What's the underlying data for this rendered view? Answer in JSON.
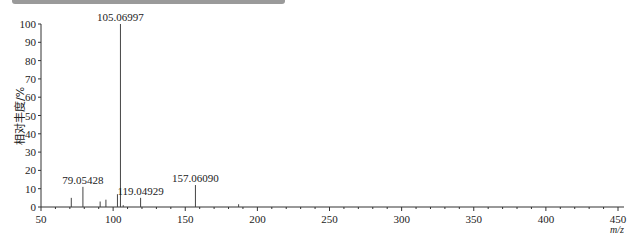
{
  "chart_data": {
    "type": "bar",
    "title": "",
    "xlabel": "m/z",
    "ylabel": "相对丰度/%",
    "xlim": [
      50,
      455
    ],
    "ylim": [
      0,
      100
    ],
    "x_ticks": [
      50,
      100,
      150,
      200,
      250,
      300,
      350,
      400,
      450
    ],
    "y_ticks": [
      0,
      10,
      20,
      30,
      40,
      50,
      60,
      70,
      80,
      90,
      100
    ],
    "grid": false,
    "legend": null,
    "peaks": [
      {
        "mz": 71,
        "intensity": 5
      },
      {
        "mz": 79.05428,
        "intensity": 11,
        "label": "79.05428"
      },
      {
        "mz": 91,
        "intensity": 3
      },
      {
        "mz": 95,
        "intensity": 4
      },
      {
        "mz": 103,
        "intensity": 7
      },
      {
        "mz": 105.06997,
        "intensity": 100,
        "label": "105.06997"
      },
      {
        "mz": 107,
        "intensity": 1
      },
      {
        "mz": 119.04929,
        "intensity": 5,
        "label": "119.04929"
      },
      {
        "mz": 157.0609,
        "intensity": 12,
        "label": "157.06090"
      },
      {
        "mz": 187,
        "intensity": 1.5
      }
    ]
  }
}
